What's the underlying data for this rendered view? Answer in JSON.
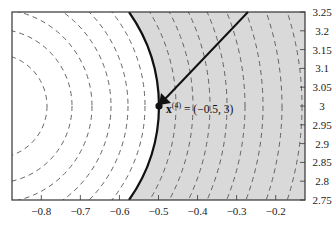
{
  "chart_data": {
    "type": "contour",
    "title": "",
    "xlabel": "",
    "ylabel": "",
    "xlim": [
      -0.875,
      -0.125
    ],
    "ylim": [
      2.75,
      3.25
    ],
    "x_ticks": [
      -0.8,
      -0.7,
      -0.6,
      -0.5,
      -0.4,
      -0.3,
      -0.2
    ],
    "x_tick_labels": [
      "−0.8",
      "−0.7",
      "−0.6",
      "−0.5",
      "−0.4",
      "−0.3",
      "−0.2"
    ],
    "y_ticks": [
      3.25,
      3.2,
      3.15,
      3.1,
      3.05,
      3,
      2.95,
      2.9,
      2.85,
      2.8,
      2.75
    ],
    "y_tick_labels": [
      "3.25",
      "3.2",
      "3.15",
      "3.1",
      "3.05",
      "3",
      "2.95",
      "2.9",
      "2.85",
      "2.8",
      "2.75"
    ],
    "y_axis_position": "right",
    "grid": false,
    "contours": {
      "style": "dashed",
      "center_approx": [
        -0.92,
        3.0
      ],
      "shape": "concentric circles"
    },
    "feasible_boundary": {
      "style": "solid-thick",
      "description": "curved boundary passing through (-0.5, 3), shaded region to the right"
    },
    "shaded_region": {
      "side": "right of boundary",
      "color": "#d9d9d9"
    },
    "point": {
      "label_base": "x",
      "label_superscript": "(4)",
      "label_value": " = (−0.5, 3)",
      "x": -0.5,
      "y": 3.0
    },
    "arrow": {
      "from": [
        -0.272,
        3.25
      ],
      "to": [
        -0.5,
        3.0
      ],
      "description": "arrow pointing to x(4)"
    }
  },
  "colors": {
    "shade": "#d9d9d9",
    "ink": "#111111",
    "dash": "#555555",
    "background": "#ffffff"
  }
}
